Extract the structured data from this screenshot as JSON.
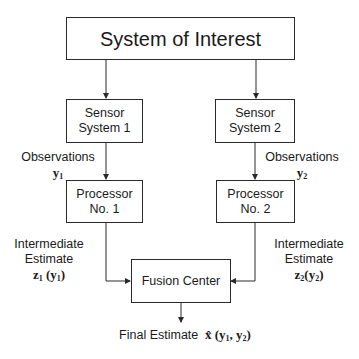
{
  "diagram": {
    "nodes": {
      "system": {
        "label": "System of Interest"
      },
      "sensor1": {
        "line1": "Sensor",
        "line2": "System 1"
      },
      "sensor2": {
        "line1": "Sensor",
        "line2": "System 2"
      },
      "processor1": {
        "line1": "Processor",
        "line2": "No. 1"
      },
      "processor2": {
        "line1": "Processor",
        "line2": "No. 2"
      },
      "fusion": {
        "label": "Fusion Center"
      }
    },
    "edges": [
      {
        "from": "system",
        "to": "sensor1"
      },
      {
        "from": "system",
        "to": "sensor2"
      },
      {
        "from": "sensor1",
        "to": "processor1",
        "label": "Observations y1"
      },
      {
        "from": "sensor2",
        "to": "processor2",
        "label": "Observations y2"
      },
      {
        "from": "processor1",
        "to": "fusion",
        "label": "Intermediate Estimate z1(y1)"
      },
      {
        "from": "processor2",
        "to": "fusion",
        "label": "Intermediate Estimate z2(y2)"
      },
      {
        "from": "fusion",
        "to": "output",
        "label": "Final Estimate x̂(y1, y2)"
      }
    ],
    "labels": {
      "obs1": {
        "text": "Observations",
        "var": "y",
        "sub": "1"
      },
      "obs2": {
        "text": "Observations",
        "var": "y",
        "sub": "2"
      },
      "inter1": {
        "line1": "Intermediate",
        "line2": "Estimate",
        "func": "z",
        "fsub": "1",
        "arg": "y",
        "asub": "1"
      },
      "inter2": {
        "line1": "Intermediate",
        "line2": "Estimate",
        "func": "z",
        "fsub": "2",
        "arg": "y",
        "asub": "2"
      },
      "final": {
        "text": "Final Estimate",
        "var": "x̂",
        "arg1": "y",
        "sub1": "1",
        "arg2": "y",
        "sub2": "2"
      }
    }
  }
}
